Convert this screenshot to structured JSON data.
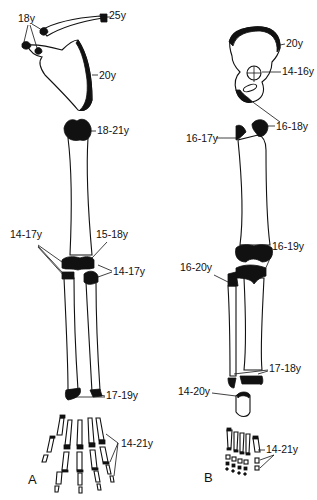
{
  "figure": {
    "panels": [
      {
        "id": "A",
        "label": "A",
        "region": "upper limb",
        "annotations": [
          {
            "bone": "clavicle (medial)",
            "age": "25y"
          },
          {
            "bone": "scapula acromion/coracoid",
            "age": "18y"
          },
          {
            "bone": "scapula medial border",
            "age": "20y"
          },
          {
            "bone": "humerus proximal",
            "age": "18-21y"
          },
          {
            "bone": "humerus distal",
            "age": "14-17y"
          },
          {
            "bone": "humerus medial epicondyle",
            "age": "15-18y"
          },
          {
            "bone": "radius/ulna proximal",
            "age": "14-17y"
          },
          {
            "bone": "radius/ulna distal",
            "age": "17-19y"
          },
          {
            "bone": "hand metacarpals/phalanges",
            "age": "14-21y"
          }
        ]
      },
      {
        "id": "B",
        "label": "B",
        "region": "lower limb",
        "annotations": [
          {
            "bone": "iliac crest",
            "age": "20y"
          },
          {
            "bone": "acetabulum",
            "age": "14-16y"
          },
          {
            "bone": "ischial tuberosity / femoral head",
            "age": "16-18y"
          },
          {
            "bone": "greater trochanter",
            "age": "16-17y"
          },
          {
            "bone": "femur distal / tibia proximal",
            "age": "16-19y"
          },
          {
            "bone": "fibula proximal",
            "age": "16-20y"
          },
          {
            "bone": "tibia/fibula distal",
            "age": "17-18y"
          },
          {
            "bone": "calcaneus",
            "age": "14-20y"
          },
          {
            "bone": "foot metatarsals/phalanges",
            "age": "14-21y"
          }
        ]
      }
    ]
  },
  "labels": {
    "a_clav": "25y",
    "a_18": "18y",
    "a_scap": "20y",
    "a_hum_prox": "18-21y",
    "a_hum_dist": "14-17y",
    "a_epic": "15-18y",
    "a_forearm_prox": "14-17y",
    "a_forearm_dist": "17-19y",
    "a_hand": "14-21y",
    "a_panel": "A",
    "b_iliac": "20y",
    "b_acet": "14-16y",
    "b_head": "16-18y",
    "b_troch": "16-17y",
    "b_knee": "16-19y",
    "b_fib_prox": "16-20y",
    "b_ankle": "17-18y",
    "b_calc": "14-20y",
    "b_foot": "14-21y",
    "b_panel": "B"
  }
}
